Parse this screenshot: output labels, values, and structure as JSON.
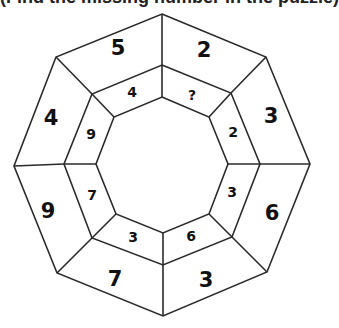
{
  "caption": "(Find the missing number in the puzzle)",
  "puzzle": {
    "outer_ring": [
      {
        "position": "top-left",
        "value": "5"
      },
      {
        "position": "top-right",
        "value": "2"
      },
      {
        "position": "right-top",
        "value": "3"
      },
      {
        "position": "right-bottom",
        "value": "6"
      },
      {
        "position": "bottom-right",
        "value": "3"
      },
      {
        "position": "bottom-left",
        "value": "7"
      },
      {
        "position": "left-bottom",
        "value": "9"
      },
      {
        "position": "left-top",
        "value": "4"
      }
    ],
    "middle_ring": [
      {
        "position": "top-left",
        "value": "4"
      },
      {
        "position": "top-right",
        "value": "?"
      },
      {
        "position": "right-top",
        "value": "2"
      },
      {
        "position": "right-bottom",
        "value": "3"
      },
      {
        "position": "bottom-right",
        "value": "6"
      },
      {
        "position": "bottom-left",
        "value": "3"
      },
      {
        "position": "left-bottom",
        "value": "7"
      },
      {
        "position": "left-top",
        "value": "9"
      }
    ]
  },
  "colors": {
    "line": "#2a2a2a",
    "text": "#111111",
    "background": "#ffffff"
  }
}
